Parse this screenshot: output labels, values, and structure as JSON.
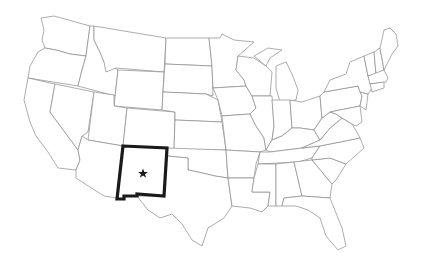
{
  "map": {
    "title": "United States — New Mexico highlighted",
    "highlighted_state": "New Mexico",
    "marker": "capital-star",
    "colors": {
      "background": "#ffffff",
      "state_border": "#8a8a8a",
      "highlight_border": "#1a1a1a",
      "marker": "#1a1a1a"
    }
  }
}
